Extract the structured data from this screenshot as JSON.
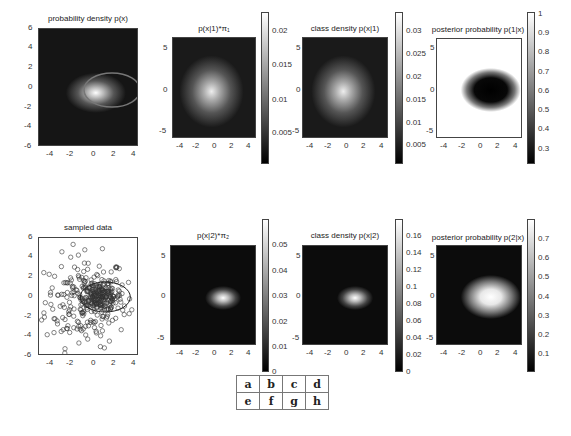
{
  "figure": {
    "panels": [
      {
        "id": "a",
        "title": "probability density p(x)",
        "xticks": [
          "-4",
          "-2",
          "0",
          "2",
          "4"
        ],
        "yticks": [
          "6",
          "4",
          "2",
          "0",
          "-2",
          "-4",
          "-6"
        ],
        "colorbar": null
      },
      {
        "id": "b",
        "title": "p(x|1)*π₁",
        "xticks": [
          "-4",
          "-2",
          "0",
          "2",
          "4"
        ],
        "yticks": [
          "5",
          "0",
          "-5"
        ],
        "colorbar": [
          "0.02",
          "0.015",
          "0.01",
          "0.005"
        ]
      },
      {
        "id": "c",
        "title": "class density p(x|1)",
        "xticks": [
          "-4",
          "-2",
          "0",
          "2",
          "4"
        ],
        "yticks": [
          "5",
          "0",
          "-5"
        ],
        "colorbar": [
          "0.03",
          "0.025",
          "0.02",
          "0.015",
          "0.01",
          "0.005"
        ]
      },
      {
        "id": "d",
        "title": "posterior probability p(1|x)",
        "xticks": [
          "-4",
          "-2",
          "0",
          "2",
          "4"
        ],
        "yticks": [
          "5",
          "0",
          "-5"
        ],
        "colorbar": [
          "1",
          "0.9",
          "0.8",
          "0.7",
          "0.6",
          "0.5",
          "0.4",
          "0.3"
        ]
      },
      {
        "id": "e",
        "title": "sampled data",
        "xticks": [
          "-4",
          "-2",
          "0",
          "2",
          "4"
        ],
        "yticks": [
          "6",
          "4",
          "2",
          "0",
          "-2",
          "-4",
          "-6"
        ],
        "colorbar": null
      },
      {
        "id": "f",
        "title": "p(x|2)*π₂",
        "xticks": [
          "-4",
          "-2",
          "0",
          "2",
          "4"
        ],
        "yticks": [
          "5",
          "0",
          "-5"
        ],
        "colorbar": [
          "0.05",
          "0.04",
          "0.03",
          "0.02",
          "0.01",
          "0"
        ]
      },
      {
        "id": "g",
        "title": "class density p(x|2)",
        "xticks": [
          "-4",
          "-2",
          "0",
          "2",
          "4"
        ],
        "yticks": [
          "5",
          "0",
          "-5"
        ],
        "colorbar": [
          "0.16",
          "0.14",
          "0.12",
          "0.1",
          "0.08",
          "0.06",
          "0.04",
          "0.02",
          "0"
        ]
      },
      {
        "id": "h",
        "title": "posterior probability p(2|x)",
        "xticks": [
          "-4",
          "-2",
          "0",
          "2",
          "4"
        ],
        "yticks": [
          "5",
          "0",
          "-5"
        ],
        "colorbar": [
          "0.7",
          "0.6",
          "0.5",
          "0.4",
          "0.3",
          "0.2",
          "0.1"
        ]
      }
    ],
    "legend_table": [
      [
        "a",
        "b",
        "c",
        "d"
      ],
      [
        "e",
        "f",
        "g",
        "h"
      ]
    ]
  },
  "chart_data": [
    {
      "type": "heatmap",
      "title": "probability density p(x)",
      "xlim": [
        -5,
        5
      ],
      "ylim": [
        -6,
        6
      ],
      "xticks": [
        -4,
        -2,
        0,
        2,
        4
      ],
      "yticks": [
        -6,
        -4,
        -2,
        0,
        2,
        4,
        6
      ],
      "peak": [
        0.5,
        0
      ],
      "annotation": "ellipse contour centered ~(1.3,0) spanning x -1 to 3.5, y -1.5 to 1.5",
      "colormap": "gray"
    },
    {
      "type": "heatmap",
      "title": "p(x|1)*π₁",
      "xlim": [
        -5,
        5
      ],
      "ylim": [
        -6,
        6
      ],
      "peak": [
        -0.5,
        -0.5
      ],
      "colorbar_ticks": [
        0.005,
        0.01,
        0.015,
        0.02
      ],
      "clim": [
        0,
        0.023
      ],
      "colormap": "gray"
    },
    {
      "type": "heatmap",
      "title": "class density p(x|1)",
      "xlim": [
        -5,
        5
      ],
      "ylim": [
        -6,
        6
      ],
      "peak": [
        -0.5,
        -0.5
      ],
      "colorbar_ticks": [
        0.005,
        0.01,
        0.015,
        0.02,
        0.025,
        0.03
      ],
      "clim": [
        0,
        0.033
      ],
      "colormap": "gray"
    },
    {
      "type": "heatmap",
      "title": "posterior probability p(1|x)",
      "xlim": [
        -5,
        5
      ],
      "ylim": [
        -6,
        6
      ],
      "dark_region_center": [
        1.2,
        0
      ],
      "colorbar_ticks": [
        0.3,
        0.4,
        0.5,
        0.6,
        0.7,
        0.8,
        0.9,
        1
      ],
      "clim": [
        0.22,
        1
      ],
      "colormap": "gray"
    },
    {
      "type": "scatter",
      "title": "sampled data",
      "xlim": [
        -5,
        4.5
      ],
      "ylim": [
        -6,
        6
      ],
      "xticks": [
        -4,
        -2,
        0,
        2,
        4
      ],
      "yticks": [
        -6,
        -4,
        -2,
        0,
        2,
        4,
        6
      ],
      "marker": "o",
      "n_points_approx": 400,
      "annotation": "ellipse contour centered ~(1.3,0)"
    },
    {
      "type": "heatmap",
      "title": "p(x|2)*π₂",
      "xlim": [
        -5,
        5
      ],
      "ylim": [
        -6,
        6
      ],
      "peak": [
        0.8,
        0
      ],
      "colorbar_ticks": [
        0,
        0.01,
        0.02,
        0.03,
        0.04,
        0.05
      ],
      "clim": [
        0,
        0.058
      ],
      "colormap": "gray"
    },
    {
      "type": "heatmap",
      "title": "class density p(x|2)",
      "xlim": [
        -5,
        5
      ],
      "ylim": [
        -6,
        6
      ],
      "peak": [
        0.8,
        0
      ],
      "colorbar_ticks": [
        0,
        0.02,
        0.04,
        0.06,
        0.08,
        0.1,
        0.12,
        0.14,
        0.16
      ],
      "clim": [
        0,
        0.17
      ],
      "colormap": "gray"
    },
    {
      "type": "heatmap",
      "title": "posterior probability p(2|x)",
      "xlim": [
        -5,
        5
      ],
      "ylim": [
        -6,
        6
      ],
      "bright_region_center": [
        1.2,
        0
      ],
      "colorbar_ticks": [
        0.1,
        0.2,
        0.3,
        0.4,
        0.5,
        0.6,
        0.7
      ],
      "clim": [
        0,
        0.78
      ],
      "colormap": "gray"
    }
  ]
}
